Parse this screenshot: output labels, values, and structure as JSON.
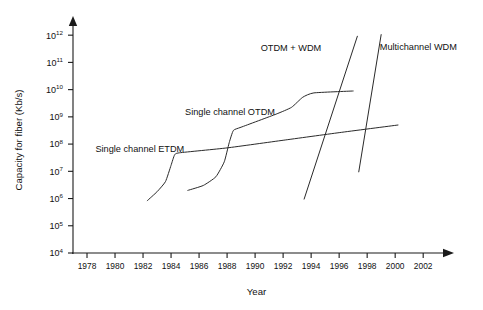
{
  "chart_data": {
    "type": "line",
    "title": "",
    "xlabel": "Year",
    "ylabel": "Capacity for fiber (Kb/s)",
    "xlim": [
      1977,
      2003.2
    ],
    "ylim": [
      4,
      12.3
    ],
    "y_scale": "log10",
    "grid": false,
    "legend_position": "inline-annotations",
    "x_ticks": [
      "1978",
      "1980",
      "1982",
      "1984",
      "1986",
      "1988",
      "1990",
      "1992",
      "1994",
      "1996",
      "1998",
      "2000",
      "2002"
    ],
    "y_ticks": [
      "10^4",
      "10^5",
      "10^6",
      "10^7",
      "10^8",
      "10^9",
      "10^10",
      "10^11",
      "10^12"
    ],
    "y_tick_bases": [
      "10",
      "10",
      "10",
      "10",
      "10",
      "10",
      "10",
      "10",
      "10"
    ],
    "y_tick_exponents": [
      "4",
      "5",
      "6",
      "7",
      "8",
      "9",
      "10",
      "11",
      "12"
    ],
    "series": [
      {
        "name": "Single channel ETDM",
        "label": "Single channel ETDM",
        "label_x": 1978.6,
        "label_y": 7.72,
        "points": [
          {
            "x": 1982.3,
            "y": 5.92
          },
          {
            "x": 1983.0,
            "y": 6.25
          },
          {
            "x": 1983.6,
            "y": 6.62
          },
          {
            "x": 1984.0,
            "y": 7.22
          },
          {
            "x": 1984.25,
            "y": 7.6
          },
          {
            "x": 1984.6,
            "y": 7.68
          },
          {
            "x": 1988.0,
            "y": 7.86
          },
          {
            "x": 1992.0,
            "y": 8.14
          },
          {
            "x": 1996.0,
            "y": 8.42
          },
          {
            "x": 2000.2,
            "y": 8.7
          }
        ]
      },
      {
        "name": "Single channel OTDM",
        "label": "Single channel OTDM",
        "label_x": 1985.0,
        "label_y": 9.05,
        "points": [
          {
            "x": 1985.2,
            "y": 6.3
          },
          {
            "x": 1986.3,
            "y": 6.48
          },
          {
            "x": 1987.2,
            "y": 6.8
          },
          {
            "x": 1987.8,
            "y": 7.35
          },
          {
            "x": 1988.15,
            "y": 8.05
          },
          {
            "x": 1988.45,
            "y": 8.5
          },
          {
            "x": 1989.0,
            "y": 8.62
          },
          {
            "x": 1991.5,
            "y": 9.1
          },
          {
            "x": 1992.6,
            "y": 9.35
          },
          {
            "x": 1993.4,
            "y": 9.72
          },
          {
            "x": 1994.2,
            "y": 9.88
          },
          {
            "x": 1997.0,
            "y": 9.95
          }
        ]
      },
      {
        "name": "OTDM + WDM",
        "label": "OTDM  + WDM",
        "label_x": 1990.4,
        "label_y": 11.42,
        "points": [
          {
            "x": 1993.5,
            "y": 5.98
          },
          {
            "x": 1997.3,
            "y": 11.96
          }
        ]
      },
      {
        "name": "Multichannel WDM",
        "label": "Multichannel WDM",
        "label_x": 1998.9,
        "label_y": 11.46,
        "points": [
          {
            "x": 1997.4,
            "y": 6.98
          },
          {
            "x": 1999.0,
            "y": 12.02
          }
        ]
      }
    ]
  }
}
